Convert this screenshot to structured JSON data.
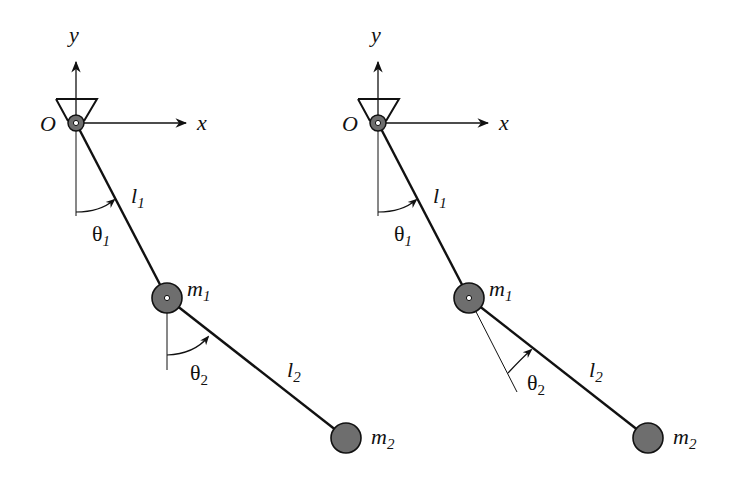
{
  "diagram": {
    "colors": {
      "line": "#111111",
      "mass_fill": "#6e6e6e",
      "pivot_fill": "#6e6e6e",
      "background": "#ffffff"
    },
    "panels": [
      {
        "id": "absolute-angles",
        "axis_x_label": "x",
        "axis_y_label": "y",
        "origin_label": "O",
        "rod1_label": "l",
        "rod1_sub": "1",
        "rod2_label": "l",
        "rod2_sub": "2",
        "mass1_label": "m",
        "mass1_sub": "1",
        "mass2_label": "m",
        "mass2_sub": "2",
        "theta1_label": "θ",
        "theta1_sub": "1",
        "theta2_label": "θ",
        "theta2_sub": "2",
        "theta2_reference": "vertical"
      },
      {
        "id": "relative-angles",
        "axis_x_label": "x",
        "axis_y_label": "y",
        "origin_label": "O",
        "rod1_label": "l",
        "rod1_sub": "1",
        "rod2_label": "l",
        "rod2_sub": "2",
        "mass1_label": "m",
        "mass1_sub": "1",
        "mass2_label": "m",
        "mass2_sub": "2",
        "theta1_label": "θ",
        "theta1_sub": "1",
        "theta2_label": "θ",
        "theta2_sub": "2",
        "theta2_reference": "extension of first rod"
      }
    ]
  }
}
